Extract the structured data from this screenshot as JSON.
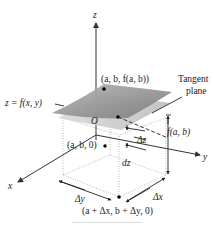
{
  "labels": {
    "z_axis": "z",
    "x_axis": "x",
    "y_axis": "y",
    "origin": "O",
    "surface": "z = f(x, y)",
    "tangent_line1": "Tangent",
    "tangent_line2": "plane",
    "point_on_surface": "(a, b, f(a, b))",
    "point_base": "(a, b, 0)",
    "point_corner": "(a + Δx, b + Δy, 0)",
    "delta_z": "Δz",
    "dz": "dz",
    "f_ab": "f(a, b)",
    "delta_x": "Δx",
    "delta_y": "Δy"
  },
  "colors": {
    "surface": "#8f8f8f",
    "plane": "#c8c8c8",
    "axis": "#333333"
  }
}
